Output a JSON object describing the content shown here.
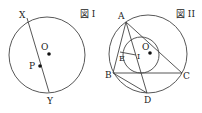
{
  "figure1": {
    "title": "図 I",
    "labels": {
      "X": "X",
      "Y": "Y",
      "O": "O",
      "P": "P"
    }
  },
  "figure2": {
    "title": "図 II",
    "labels": {
      "A": "A",
      "B": "B",
      "C": "C",
      "D": "D",
      "O": "O",
      "I": "I",
      "E": "E"
    }
  }
}
